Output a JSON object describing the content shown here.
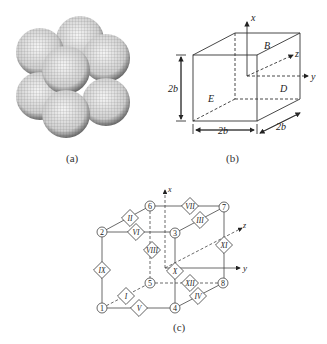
{
  "figure": {
    "panels": [
      {
        "id": "a",
        "caption": "(a)",
        "description": "Cluster of eight wireframe spheres arranged as a 2x2x2 cubic stack"
      },
      {
        "id": "b",
        "caption": "(b)",
        "description": "Cube with coordinate axes",
        "axes": {
          "x": "x",
          "y": "y",
          "z": "z"
        },
        "face_labels": {
          "top": "B",
          "right": "D",
          "front": "E"
        },
        "dimensions": {
          "height": "2b",
          "width": "2b",
          "depth": "2b"
        }
      },
      {
        "id": "c",
        "caption": "(c)",
        "description": "Node/element graph of cube vertices with diamond connectors",
        "axes": {
          "x": "x",
          "y": "y",
          "z": "z"
        },
        "nodes": [
          "1",
          "2",
          "3",
          "4",
          "5",
          "6",
          "7",
          "8"
        ],
        "elements": [
          "I",
          "II",
          "III",
          "IV",
          "V",
          "VI",
          "VII",
          "VIII",
          "IX",
          "X",
          "XI",
          "XII"
        ]
      }
    ]
  },
  "captions": {
    "a": "(a)",
    "b": "(b)",
    "c": "(c)"
  },
  "b_labels": {
    "x": "x",
    "y": "y",
    "z": "z",
    "B": "B",
    "D": "D",
    "E": "E",
    "h": "2b",
    "w": "2b",
    "d": "2b"
  },
  "c_labels": {
    "x": "x",
    "y": "y",
    "z": "z",
    "n1": "1",
    "n2": "2",
    "n3": "3",
    "n4": "4",
    "n5": "5",
    "n6": "6",
    "n7": "7",
    "n8": "8",
    "eI": "I",
    "eII": "II",
    "eIII": "III",
    "eIV": "IV",
    "eV": "V",
    "eVI": "VI",
    "eVII": "VII",
    "eVIII": "VIII",
    "eIX": "IX",
    "eX": "X",
    "eXI": "XI",
    "eXII": "XII"
  }
}
